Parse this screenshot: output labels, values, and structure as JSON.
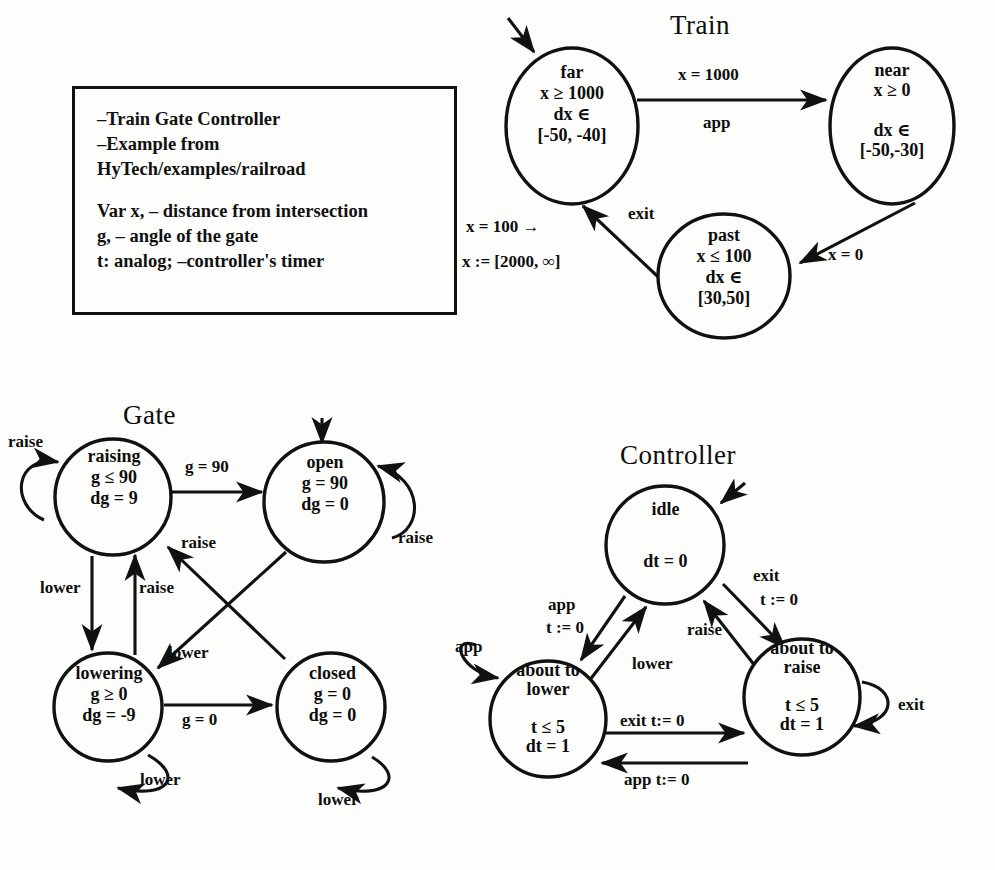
{
  "legend": {
    "lines": [
      "–Train Gate Controller",
      "–Example from",
      " HyTech/examples/railroad"
    ],
    "lines2": [
      "Var x, – distance from intersection",
      " g, – angle of the gate",
      " t: analog; –controller's timer"
    ]
  },
  "train": {
    "title": "Train",
    "nodes": [
      {
        "name": "far",
        "label": "far\nx ≥ 1000\ndx ∈\n[-50, -40]"
      },
      {
        "name": "near",
        "label": "near\nx ≥ 0\n\ndx ∈\n[-50,-30]"
      },
      {
        "name": "past",
        "label": "past\nx ≤ 100\ndx ∈\n[30,50]"
      }
    ],
    "edges": [
      {
        "name": "far-to-near-guard",
        "label": "x = 1000"
      },
      {
        "name": "far-to-near-event",
        "label": "app"
      },
      {
        "name": "near-to-past-guard",
        "label": "x = 0"
      },
      {
        "name": "past-to-far-event",
        "label": "exit"
      },
      {
        "name": "past-to-far-guard",
        "label": "x = 100 →"
      },
      {
        "name": "past-to-far-assign",
        "label": "x := [2000, ∞]"
      }
    ]
  },
  "gate": {
    "title": "Gate",
    "nodes": [
      {
        "name": "raising",
        "label": "raising\ng ≤ 90\ndg = 9"
      },
      {
        "name": "open",
        "label": "open\ng = 90\ndg = 0"
      },
      {
        "name": "lowering",
        "label": "lowering\ng ≥ 0\ndg = -9"
      },
      {
        "name": "closed",
        "label": "closed\ng = 0\ndg = 0"
      }
    ],
    "edges": [
      {
        "name": "raising-self",
        "label": "raise"
      },
      {
        "name": "raising-to-open",
        "label": "g = 90"
      },
      {
        "name": "open-self",
        "label": "raise"
      },
      {
        "name": "raising-to-lowering",
        "label": "lower"
      },
      {
        "name": "lowering-to-raising",
        "label": "raise"
      },
      {
        "name": "closed-to-raising",
        "label": "raise"
      },
      {
        "name": "open-to-lowering",
        "label": "lower"
      },
      {
        "name": "lowering-to-closed",
        "label": "g = 0"
      },
      {
        "name": "lowering-self",
        "label": "lower"
      },
      {
        "name": "closed-self",
        "label": "lower"
      }
    ]
  },
  "controller": {
    "title": "Controller",
    "nodes": [
      {
        "name": "idle",
        "label": "idle\n\ndt = 0"
      },
      {
        "name": "about-to-lower",
        "label": "about to\nlower\n\nt ≤ 5\ndt = 1"
      },
      {
        "name": "about-to-raise",
        "label": "about to\nraise\n\nt ≤ 5\ndt = 1"
      }
    ],
    "edges": [
      {
        "name": "idle-to-lower-event",
        "label": "app"
      },
      {
        "name": "idle-to-lower-assign",
        "label": "t := 0"
      },
      {
        "name": "lower-to-idle",
        "label": "lower"
      },
      {
        "name": "raise-to-idle",
        "label": "raise"
      },
      {
        "name": "idle-to-raise-event",
        "label": "exit"
      },
      {
        "name": "idle-to-raise-assign",
        "label": "t := 0"
      },
      {
        "name": "lower-self",
        "label": "app"
      },
      {
        "name": "raise-self",
        "label": "exit"
      },
      {
        "name": "lower-to-raise",
        "label": "exit t:= 0"
      },
      {
        "name": "raise-to-lower",
        "label": "app t:= 0"
      }
    ]
  }
}
